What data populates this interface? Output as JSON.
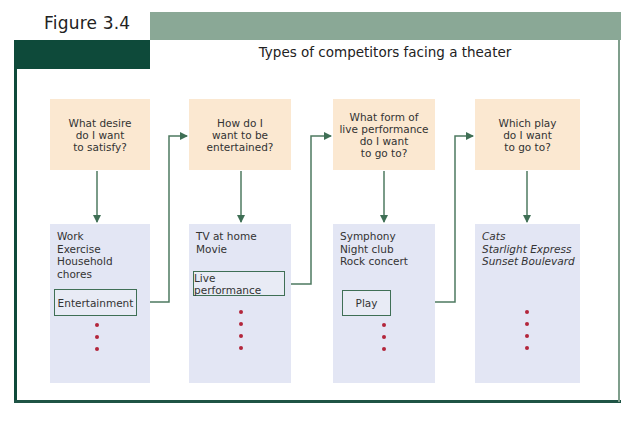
{
  "figure": {
    "label": "Figure 3.4",
    "title": "Types of competitors facing a theater"
  },
  "colors": {
    "dark_green": "#0e4a3a",
    "light_green": "#8aa896",
    "question_fill": "#fbe8d1",
    "option_fill": "#e3e6f4",
    "connector": "#3f6f55",
    "dot": "#b3263a"
  },
  "columns": [
    {
      "question": "What desire\ndo I want\nto satisfy?",
      "options": [
        "Work",
        "Exercise",
        "Household chores"
      ],
      "options_italic": false,
      "highlight": "Entertainment",
      "dots": 3
    },
    {
      "question": "How do I\nwant to be\nentertained?",
      "options": [
        "TV at home",
        "Movie"
      ],
      "options_italic": false,
      "highlight": "Live performance",
      "dots": 4
    },
    {
      "question": "What form of\nlive performance\ndo I want\nto go to?",
      "options": [
        "Symphony",
        "Night club",
        "Rock concert"
      ],
      "options_italic": false,
      "highlight": "Play",
      "dots": 3
    },
    {
      "question": "Which play\ndo I want\nto go to?",
      "options": [
        "Cats",
        "Starlight Express",
        "Sunset Boulevard"
      ],
      "options_italic": true,
      "highlight": null,
      "dots": 4
    }
  ]
}
